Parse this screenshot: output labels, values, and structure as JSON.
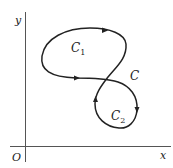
{
  "diagram": {
    "type": "closed-curve-figure",
    "axes": {
      "x_label": "x",
      "y_label": "y",
      "origin_label": "O"
    },
    "curve": {
      "label": "C",
      "subcurves": [
        {
          "label": "C",
          "sub": "1",
          "description": "upper loop"
        },
        {
          "label": "C",
          "sub": "2",
          "description": "lower loop"
        }
      ],
      "arrows": [
        {
          "position": "top of upper loop",
          "direction": "right"
        },
        {
          "position": "bottom of upper loop",
          "direction": "right"
        },
        {
          "position": "left of lower loop",
          "direction": "up"
        },
        {
          "position": "right of lower loop",
          "direction": "down"
        }
      ]
    },
    "colors": {
      "stroke": "#222222",
      "axis": "#555555",
      "background": "#ffffff"
    }
  }
}
